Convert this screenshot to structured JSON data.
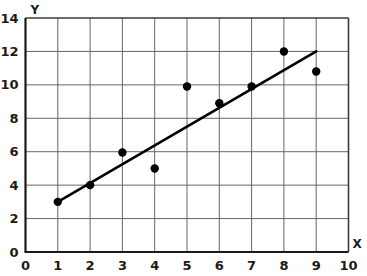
{
  "chart_data": {
    "type": "scatter",
    "title": "",
    "xlabel": "X",
    "ylabel": "Y",
    "xlim": [
      0,
      10
    ],
    "ylim": [
      0,
      14
    ],
    "grid": true,
    "legend": "none",
    "x_ticks": [
      "0",
      "1",
      "2",
      "3",
      "4",
      "5",
      "6",
      "7",
      "8",
      "9",
      "10"
    ],
    "y_ticks": [
      "0",
      "2",
      "4",
      "6",
      "8",
      "10",
      "12",
      "14"
    ],
    "x_tick_values": [
      0,
      1,
      2,
      3,
      4,
      5,
      6,
      7,
      8,
      9,
      10
    ],
    "y_tick_values": [
      0,
      2,
      4,
      6,
      8,
      10,
      12,
      14
    ],
    "points": [
      {
        "x": 1,
        "y": 3.0
      },
      {
        "x": 2,
        "y": 4.0
      },
      {
        "x": 3,
        "y": 5.95
      },
      {
        "x": 4,
        "y": 5.0
      },
      {
        "x": 5,
        "y": 9.9
      },
      {
        "x": 6,
        "y": 8.9
      },
      {
        "x": 7,
        "y": 9.9
      },
      {
        "x": 8,
        "y": 12.0
      },
      {
        "x": 9,
        "y": 10.8
      }
    ],
    "series": [
      {
        "name": "data-points",
        "type": "scatter",
        "x": [
          1,
          2,
          3,
          4,
          5,
          6,
          7,
          8,
          9
        ],
        "values": [
          3.0,
          4.0,
          5.95,
          5.0,
          9.9,
          8.9,
          9.9,
          12.0,
          10.8
        ]
      },
      {
        "name": "trend-line",
        "type": "line",
        "x": [
          1,
          9
        ],
        "values": [
          3.0,
          12.0
        ]
      }
    ],
    "trend_line": {
      "x_start": 1,
      "y_start": 3.0,
      "x_end": 9,
      "y_end": 12.0,
      "slope": 1.125,
      "intercept": 1.875
    },
    "colors": {
      "point": "#000000",
      "line": "#000000",
      "grid": "#666666",
      "axis": "#1a1a1a",
      "background": "#ffffff"
    },
    "style": {
      "point_radius": 4.2,
      "line_width": 2.6,
      "grid_width": 1,
      "axis_width": 2.2
    }
  }
}
